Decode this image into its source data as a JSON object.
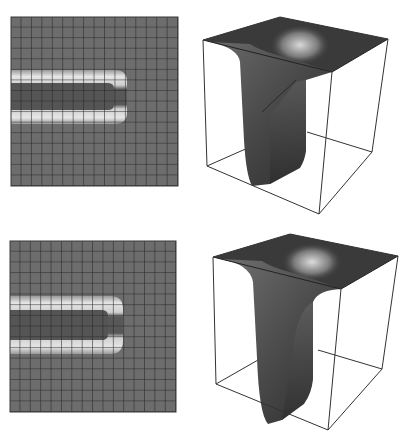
{
  "figure": {
    "panels": [
      {
        "id": "top",
        "grid_map": {
          "x": 11,
          "y": 17,
          "width": 167,
          "height": 169,
          "rows": 16,
          "cols": 16,
          "background": "#6e6e6e",
          "gridline": "#2a2a2a",
          "halo_color": "#d6d6d6",
          "core_color": "#4f4f4f",
          "trench": {
            "col_end": 10.6,
            "row_start": 5.0,
            "row_end": 10.2,
            "core_row_start": 6.2,
            "core_row_end": 8.6
          }
        },
        "surface_3d": {
          "box": {
            "top": [
              [
                203,
                40
              ],
              [
                280,
                17
              ],
              [
                388,
                39
              ],
              [
                332,
                72
              ]
            ],
            "bottom": [
              [
                207,
                166
              ],
              [
                282,
                136
              ],
              [
                372,
                152
              ],
              [
                319,
                214
              ]
            ]
          },
          "trench": {
            "opening": [
              [
                205,
                42
              ],
              [
                240,
                56
              ],
              [
                296,
                80
              ],
              [
                332,
                72
              ],
              [
                300,
                60
              ],
              [
                250,
                45
              ]
            ],
            "left_wall": [
              [
                240,
                56
              ],
              [
                245,
                130
              ],
              [
                253,
                185
              ],
              [
                268,
                184
              ],
              [
                300,
                165
              ]
            ],
            "right_wall": [
              [
                296,
                80
              ],
              [
                306,
                150
              ],
              [
                300,
                165
              ]
            ]
          }
        }
      },
      {
        "id": "bottom",
        "grid_map": {
          "x": 10,
          "y": 241,
          "width": 166,
          "height": 171,
          "rows": 16,
          "cols": 16,
          "background": "#6e6e6e",
          "gridline": "#2a2a2a",
          "halo_color": "#d6d6d6",
          "core_color": "#4f4f4f",
          "trench": {
            "col_end": 10.6,
            "row_start": 5.0,
            "row_end": 10.2,
            "core_row_start": 6.2,
            "core_row_end": 8.6
          }
        },
        "surface_3d": {
          "box": {
            "top": [
              [
                213,
                257
              ],
              [
                290,
                234
              ],
              [
                398,
                256
              ],
              [
                341,
                289
              ]
            ],
            "bottom": [
              [
                216,
                384
              ],
              [
                292,
                352
              ],
              [
                382,
                369
              ],
              [
                328,
                430
              ]
            ]
          }
        }
      }
    ]
  }
}
